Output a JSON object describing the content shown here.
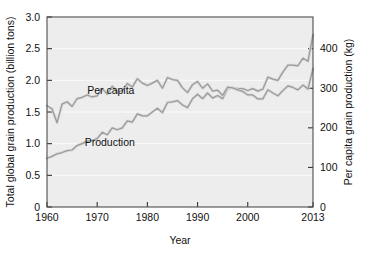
{
  "chart_data": {
    "type": "line",
    "title": "",
    "xlabel": "Year",
    "ylabel": "Total global grain production (billion tons)",
    "ylabel_right": "Per capita grain production (kg)",
    "xlim": [
      1960,
      2013
    ],
    "ylim": [
      0,
      3.0
    ],
    "ylim_right": [
      0,
      480
    ],
    "grid": true,
    "legend": "inline-annotations",
    "x_ticks": [
      1960,
      1970,
      1980,
      1990,
      2000,
      2013
    ],
    "x_tick_labels": [
      "1960",
      "1970",
      "1980",
      "1990",
      "2000",
      "2013"
    ],
    "y_ticks_left": [
      0,
      0.5,
      1.0,
      1.5,
      2.0,
      2.5,
      3.0
    ],
    "y_tick_labels_left": [
      "0",
      "0.5",
      "1.0",
      "1.5",
      "2.0",
      "2.5",
      "3.0"
    ],
    "y_ticks_right": [
      0,
      100,
      200,
      300,
      400
    ],
    "y_tick_labels_right": [
      "0",
      "100",
      "200",
      "300",
      "400"
    ],
    "annotations": [
      {
        "text": "Per capita",
        "x": 1968.0,
        "y": 1.78
      },
      {
        "text": "Production",
        "x": 1967.5,
        "y": 0.97
      }
    ],
    "x": [
      1960,
      1961,
      1962,
      1963,
      1964,
      1965,
      1966,
      1967,
      1968,
      1969,
      1970,
      1971,
      1972,
      1973,
      1974,
      1975,
      1976,
      1977,
      1978,
      1979,
      1980,
      1981,
      1982,
      1983,
      1984,
      1985,
      1986,
      1987,
      1988,
      1989,
      1990,
      1991,
      1992,
      1993,
      1994,
      1995,
      1996,
      1997,
      1998,
      1999,
      2000,
      2001,
      2002,
      2003,
      2004,
      2005,
      2006,
      2007,
      2008,
      2009,
      2010,
      2011,
      2012,
      2013
    ],
    "series": [
      {
        "name": "Production",
        "units": "billion tons",
        "axis": "left",
        "color": "#9a9a9a",
        "values": [
          0.77,
          0.8,
          0.84,
          0.86,
          0.89,
          0.9,
          0.97,
          1.0,
          1.04,
          1.05,
          1.08,
          1.18,
          1.14,
          1.25,
          1.22,
          1.25,
          1.36,
          1.34,
          1.47,
          1.44,
          1.44,
          1.5,
          1.56,
          1.49,
          1.65,
          1.66,
          1.68,
          1.61,
          1.57,
          1.71,
          1.78,
          1.71,
          1.8,
          1.72,
          1.76,
          1.71,
          1.87,
          1.88,
          1.87,
          1.87,
          1.84,
          1.87,
          1.83,
          1.86,
          2.05,
          2.02,
          2.0,
          2.13,
          2.24,
          2.24,
          2.23,
          2.35,
          2.3,
          2.72
        ]
      },
      {
        "name": "Per capita",
        "units": "kg",
        "axis": "right",
        "color": "#9a9a9a",
        "values": [
          256,
          248,
          213,
          260,
          266,
          254,
          274,
          277,
          283,
          278,
          281,
          299,
          285,
          305,
          291,
          294,
          312,
          303,
          324,
          313,
          307,
          313,
          320,
          300,
          327,
          322,
          320,
          301,
          289,
          309,
          317,
          300,
          311,
          293,
          295,
          282,
          303,
          301,
          296,
          292,
          283,
          283,
          273,
          273,
          296,
          288,
          281,
          294,
          306,
          302,
          296,
          308,
          298,
          350
        ]
      }
    ]
  },
  "axis_labels": {
    "left": "Total global grain production (billion tons)",
    "right": "Per capita grain production (kg)",
    "bottom": "Year"
  }
}
